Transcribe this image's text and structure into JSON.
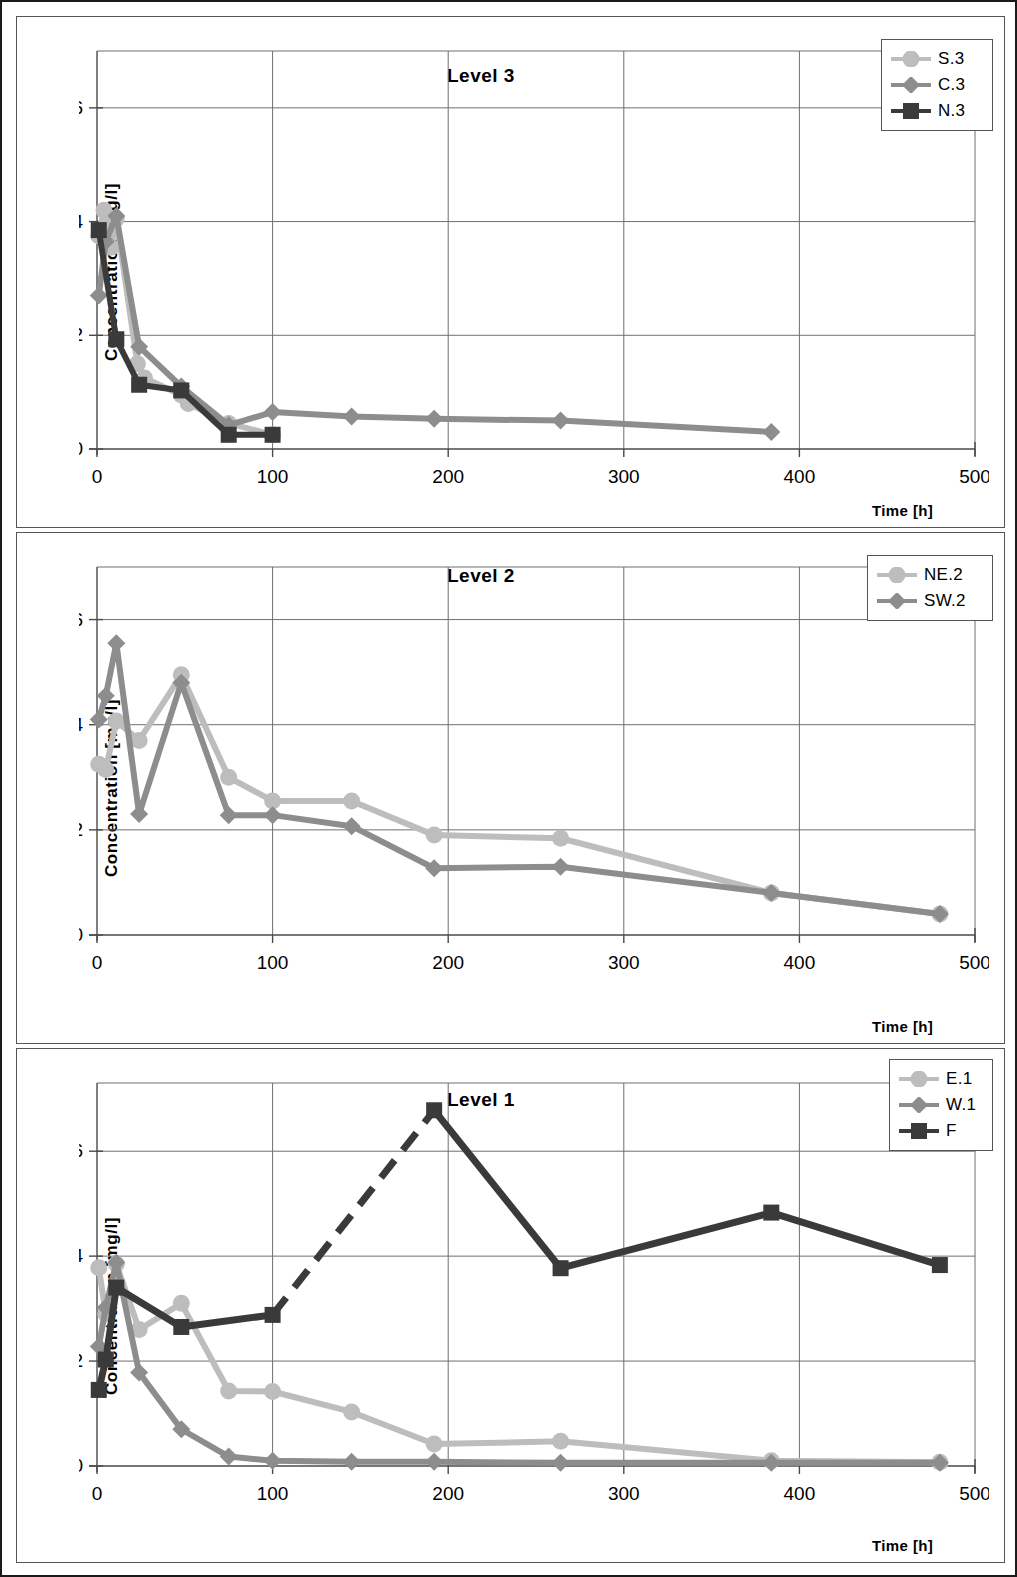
{
  "figure": {
    "ylabel": "Concentration [mg/l]",
    "xlabel": "Time [h]",
    "xticks": [
      "0",
      "100",
      "200",
      "300",
      "400",
      "500"
    ],
    "yticks": [
      "0",
      "2",
      "4",
      "6"
    ],
    "colors": {
      "light_gray": "#bdbdbd",
      "mid_gray": "#8d8d8d",
      "dark": "#3a3a3a",
      "grid": "#6f6f6f",
      "axis": "#4a4a4a"
    }
  },
  "chart_data": [
    {
      "type": "line",
      "title": "Level 3",
      "xlabel": "Time [h]",
      "ylabel": "Concentration [mg/l]",
      "xlim": [
        0,
        500
      ],
      "ylim": [
        0,
        7
      ],
      "xticks": [
        0,
        100,
        200,
        300,
        400,
        500
      ],
      "yticks": [
        0,
        2,
        4,
        6
      ],
      "grid": true,
      "legend_position": "top-right",
      "series": [
        {
          "name": "S.3",
          "color": "#bdbdbd",
          "marker": "circle",
          "dash": false,
          "x": [
            1,
            4,
            8,
            11,
            23,
            27,
            48,
            52,
            75,
            100
          ],
          "y": [
            3.75,
            4.2,
            3.55,
            4.05,
            1.5,
            1.25,
            0.95,
            0.8,
            0.45,
            0.25
          ]
        },
        {
          "name": "C.3",
          "color": "#8d8d8d",
          "marker": "diamond",
          "dash": false,
          "x": [
            1,
            5,
            11,
            24,
            48,
            75,
            100,
            145,
            192,
            264,
            384
          ],
          "y": [
            2.7,
            3.65,
            4.1,
            1.8,
            1.1,
            0.42,
            0.65,
            0.57,
            0.53,
            0.5,
            0.3
          ]
        },
        {
          "name": "N.3",
          "color": "#3a3a3a",
          "marker": "square",
          "dash": false,
          "x": [
            1,
            11,
            24,
            48,
            75,
            100
          ],
          "y": [
            3.85,
            1.93,
            1.13,
            1.03,
            0.25,
            0.25
          ]
        }
      ]
    },
    {
      "type": "line",
      "title": "Level 2",
      "xlabel": "Time [h]",
      "ylabel": "Concentration [mg/l]",
      "xlim": [
        0,
        500
      ],
      "ylim": [
        0,
        7
      ],
      "xticks": [
        0,
        100,
        200,
        300,
        400,
        500
      ],
      "yticks": [
        0,
        2,
        4,
        6
      ],
      "grid": true,
      "legend_position": "top-right",
      "series": [
        {
          "name": "NE.2",
          "color": "#bdbdbd",
          "marker": "circle",
          "dash": false,
          "x": [
            1,
            5,
            11,
            24,
            48,
            75,
            100,
            145,
            192,
            264,
            384,
            480
          ],
          "y": [
            3.25,
            3.15,
            4.07,
            3.7,
            4.95,
            3.0,
            2.55,
            2.55,
            1.9,
            1.84,
            0.8,
            0.4
          ]
        },
        {
          "name": "SW.2",
          "color": "#8d8d8d",
          "marker": "diamond",
          "dash": false,
          "x": [
            1,
            5,
            11,
            24,
            48,
            75,
            100,
            145,
            192,
            264,
            384,
            480
          ],
          "y": [
            4.1,
            4.55,
            5.55,
            2.3,
            4.8,
            2.28,
            2.28,
            2.07,
            1.27,
            1.3,
            0.8,
            0.4
          ]
        }
      ]
    },
    {
      "type": "line",
      "title": "Level 1",
      "xlabel": "Time [h]",
      "ylabel": "Concentration [mg/l]",
      "xlim": [
        0,
        500
      ],
      "ylim": [
        0,
        7.3
      ],
      "xticks": [
        0,
        100,
        200,
        300,
        400,
        500
      ],
      "yticks": [
        0,
        2,
        4,
        6
      ],
      "grid": true,
      "legend_position": "top-right",
      "series": [
        {
          "name": "E.1",
          "color": "#bdbdbd",
          "marker": "circle",
          "dash": false,
          "x": [
            1,
            5,
            11,
            24,
            48,
            75,
            100,
            145,
            192,
            264,
            384,
            480
          ],
          "y": [
            3.78,
            2.9,
            3.85,
            2.6,
            3.1,
            1.43,
            1.42,
            1.03,
            0.42,
            0.47,
            0.1,
            0.07
          ]
        },
        {
          "name": "W.1",
          "color": "#8d8d8d",
          "marker": "diamond",
          "dash": false,
          "x": [
            1,
            5,
            11,
            24,
            48,
            75,
            100,
            145,
            192,
            264,
            384,
            480
          ],
          "y": [
            2.28,
            3.02,
            3.88,
            1.78,
            0.7,
            0.18,
            0.1,
            0.08,
            0.08,
            0.06,
            0.06,
            0.06
          ]
        },
        {
          "name": "F",
          "color": "#3a3a3a",
          "marker": "square",
          "dash_segment": [
            100,
            192
          ],
          "x": [
            1,
            5,
            11,
            48,
            100,
            192,
            264,
            384,
            480
          ],
          "y": [
            1.45,
            2.03,
            3.4,
            2.65,
            2.88,
            6.78,
            3.77,
            4.83,
            3.83
          ]
        }
      ]
    }
  ]
}
